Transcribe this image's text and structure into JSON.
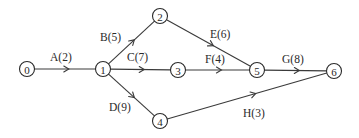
{
  "diagram": {
    "type": "activity-on-arrow network",
    "nodes": [
      {
        "id": "0",
        "label": "0",
        "x": 27,
        "y": 69
      },
      {
        "id": "1",
        "label": "1",
        "x": 103,
        "y": 69
      },
      {
        "id": "2",
        "label": "2",
        "x": 160,
        "y": 16
      },
      {
        "id": "3",
        "label": "3",
        "x": 178,
        "y": 70
      },
      {
        "id": "4",
        "label": "4",
        "x": 160,
        "y": 121
      },
      {
        "id": "5",
        "label": "5",
        "x": 257,
        "y": 70
      },
      {
        "id": "6",
        "label": "6",
        "x": 334,
        "y": 71
      }
    ],
    "edges": [
      {
        "id": "A",
        "label": "A(2)",
        "from": "0",
        "to": "1",
        "duration": 2,
        "label_x": 50,
        "label_y": 61
      },
      {
        "id": "B",
        "label": "B(5)",
        "from": "1",
        "to": "2",
        "duration": 5,
        "label_x": 100,
        "label_y": 41
      },
      {
        "id": "C",
        "label": "C(7)",
        "from": "1",
        "to": "3",
        "duration": 7,
        "label_x": 127,
        "label_y": 61
      },
      {
        "id": "D",
        "label": "D(9)",
        "from": "1",
        "to": "4",
        "duration": 9,
        "label_x": 109,
        "label_y": 111
      },
      {
        "id": "E",
        "label": "E(6)",
        "from": "2",
        "to": "5",
        "duration": 6,
        "label_x": 210,
        "label_y": 38
      },
      {
        "id": "F",
        "label": "F(4)",
        "from": "3",
        "to": "5",
        "duration": 4,
        "label_x": 205,
        "label_y": 63
      },
      {
        "id": "G",
        "label": "G(8)",
        "from": "5",
        "to": "6",
        "duration": 8,
        "label_x": 282,
        "label_y": 63
      },
      {
        "id": "H",
        "label": "H(3)",
        "from": "4",
        "to": "6",
        "duration": 3,
        "label_x": 243,
        "label_y": 117
      }
    ]
  }
}
